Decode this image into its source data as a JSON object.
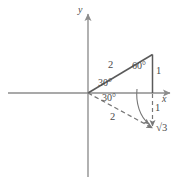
{
  "figure": {
    "colors": {
      "background": "#ffffff",
      "axis": "#8c8c8c",
      "solid_line": "#5a5a5a",
      "dashed_line": "#777777",
      "text": "#4a4a4a"
    },
    "axes": {
      "x_label": "x",
      "y_label": "y",
      "origin": {
        "x": 88,
        "y": 93
      }
    },
    "labels": {
      "hyp_upper": "2",
      "angle_upper_origin": "30°",
      "angle_apex": "60°",
      "side_vertical_upper": "1",
      "angle_lower_origin": "30°",
      "hyp_lower": "2",
      "side_vertical_lower": "1",
      "base_label": "√3"
    },
    "radical": {
      "symbol": "√",
      "radicand": "3"
    }
  }
}
